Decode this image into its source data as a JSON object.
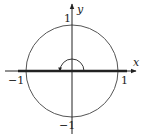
{
  "diagram": {
    "axes": {
      "x_label": "x",
      "y_label": "y"
    },
    "ticks": {
      "x_neg": "−1",
      "x_pos": "1",
      "y_pos": "1",
      "y_neg": "−1"
    },
    "elements": [
      {
        "type": "circle",
        "center": [
          0,
          0
        ],
        "radius": 1
      },
      {
        "type": "segment",
        "from": [
          -1,
          0
        ],
        "to": [
          1,
          0
        ],
        "style": "thick"
      },
      {
        "type": "angle-arc",
        "from_angle": 0,
        "to_angle": "pi",
        "direction": "counterclockwise"
      }
    ],
    "colors": {
      "stroke": "#222222",
      "circle": "#555555",
      "background": "#ffffff"
    }
  }
}
